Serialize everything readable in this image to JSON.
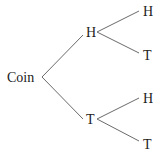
{
  "diagram": {
    "type": "tree",
    "title": "",
    "colors": {
      "text": "#222222",
      "edge": "#6a6a6a",
      "background": "#ffffff"
    },
    "root": {
      "label": "Coin"
    },
    "level1": [
      {
        "label": "H",
        "children": [
          {
            "label": "H"
          },
          {
            "label": "T"
          }
        ]
      },
      {
        "label": "T",
        "children": [
          {
            "label": "H"
          },
          {
            "label": "T"
          }
        ]
      }
    ]
  }
}
